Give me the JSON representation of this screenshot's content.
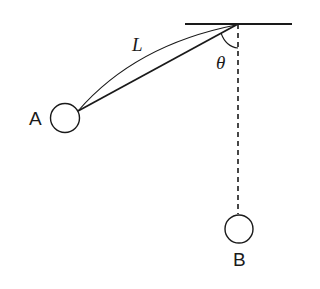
{
  "diagram": {
    "type": "pendulum",
    "labels": {
      "length": "L",
      "angle": "θ",
      "point_a": "A",
      "point_b": "B"
    },
    "colors": {
      "stroke": "#1a1a1a",
      "background": "#ffffff"
    }
  }
}
